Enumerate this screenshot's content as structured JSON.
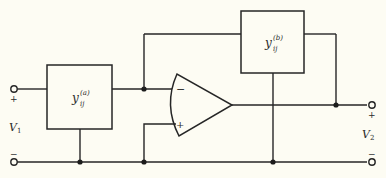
{
  "diagram": {
    "type": "circuit-schematic",
    "blocks": [
      {
        "id": "ya",
        "base": "y",
        "subscript": "ij",
        "superscript": "(a)"
      },
      {
        "id": "yb",
        "base": "y",
        "subscript": "ij",
        "superscript": "(b)"
      }
    ],
    "opamp": {
      "inverting_label": "−",
      "noninverting_label": "+"
    },
    "ports": {
      "input": {
        "name": "V",
        "subscript": "1",
        "plus": "+",
        "minus": "−"
      },
      "output": {
        "name": "V",
        "subscript": "2",
        "plus": "+",
        "minus": "−"
      }
    },
    "colors": {
      "background": "#fdfcf3",
      "line": "#262626"
    }
  }
}
